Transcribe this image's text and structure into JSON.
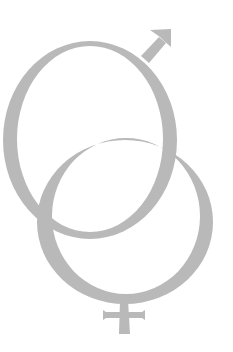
{
  "image": {
    "description": "Interlocking male and female gender symbols",
    "alt": "Male and female symbols interlocked",
    "colors": {
      "background": "#ffffff",
      "symbol": "#b9b9b9"
    },
    "symbols": [
      {
        "name": "male-symbol",
        "icon": "mars-icon"
      },
      {
        "name": "female-symbol",
        "icon": "venus-icon"
      }
    ]
  }
}
